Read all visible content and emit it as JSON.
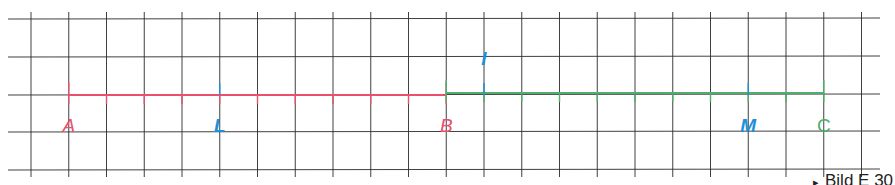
{
  "figure": {
    "caption": "Bild E 30",
    "caption_marker": "▸"
  },
  "grid": {
    "x0": 31,
    "spacing_x": 37.75,
    "columns": 23,
    "y_lines": [
      19,
      57,
      95,
      132,
      170
    ],
    "x_left": 8,
    "x_right": 880,
    "color": "#2a2a2a"
  },
  "colors": {
    "pink": "#e8506e",
    "green": "#4caf6a",
    "blue": "#1e8fd8"
  },
  "segments": [
    {
      "name": "AB",
      "from_col": 1,
      "to_col": 11,
      "y": 95,
      "color": "#e8506e"
    },
    {
      "name": "BC",
      "from_col": 11,
      "to_col": 21,
      "y": 93,
      "color": "#4caf6a"
    }
  ],
  "points": [
    {
      "label": "A",
      "col": 1,
      "color": "#e8506e",
      "italic": true,
      "bold": false
    },
    {
      "label": "L",
      "col": 5,
      "color": "#1e8fd8",
      "italic": true,
      "bold": true
    },
    {
      "label": "B",
      "col": 11,
      "color": "#e8506e",
      "italic": true,
      "bold": false
    },
    {
      "label": "M",
      "col": 19,
      "color": "#1e8fd8",
      "italic": true,
      "bold": true
    },
    {
      "label": "C",
      "col": 21,
      "color": "#4caf6a",
      "italic": false,
      "bold": false
    }
  ],
  "midpoint_marker": {
    "label": "I",
    "col": 12,
    "color": "#1e8fd8"
  }
}
